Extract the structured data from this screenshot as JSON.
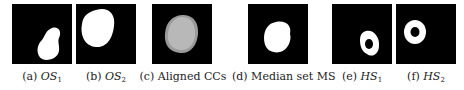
{
  "figure": {
    "panels": [
      {
        "id": "a",
        "tag": "(a)",
        "math": "OS",
        "sub": "1",
        "label": "(a) OS1",
        "content": "single binary blob lower-right"
      },
      {
        "id": "b",
        "tag": "(b)",
        "math": "OS",
        "sub": "2",
        "label": "(b) OS2",
        "content": "single binary blob upper-left"
      },
      {
        "id": "c",
        "tag": "(c)",
        "text": "Aligned CCs",
        "label": "(c) Aligned CCs",
        "content": "overlaid gray blobs centered"
      },
      {
        "id": "d",
        "tag": "(d)",
        "text": "Median set MS",
        "label": "(d) Median set MS",
        "content": "white median blob centered"
      },
      {
        "id": "e",
        "tag": "(e)",
        "math": "HS",
        "sub": "1",
        "label": "(e) HS1",
        "content": "ring with hole lower-right"
      },
      {
        "id": "f",
        "tag": "(f)",
        "math": "HS",
        "sub": "2",
        "label": "(f) HS2",
        "content": "ring with hole upper-left"
      }
    ],
    "colors": {
      "background": "#000000",
      "foreground": "#ffffff",
      "overlay": "#b0b0b0"
    }
  }
}
